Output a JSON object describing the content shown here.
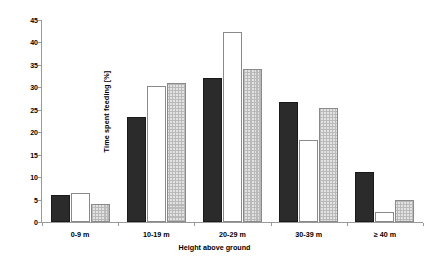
{
  "chart_data": {
    "type": "bar",
    "title": "",
    "xlabel": "Height above ground",
    "ylabel": "Time spent feeding [%]",
    "categories": [
      "0-9 m",
      "10-19 m",
      "20-29 m",
      "30-39 m",
      "≥ 40 m"
    ],
    "series": [
      {
        "name": "black",
        "fill": "black",
        "values": [
          6.0,
          23.5,
          32.1,
          26.8,
          11.2
        ]
      },
      {
        "name": "white",
        "fill": "white",
        "values": [
          6.4,
          30.2,
          42.4,
          18.3,
          2.3
        ]
      },
      {
        "name": "gray",
        "fill": "gray-stippled",
        "values": [
          4.1,
          31.0,
          34.1,
          25.5,
          5.0
        ]
      }
    ],
    "ylim": [
      0,
      45
    ],
    "yticks": [
      0,
      5,
      10,
      15,
      20,
      25,
      30,
      35,
      40,
      45
    ],
    "ytick_labels": [
      "0",
      "5",
      "10",
      "15",
      "20",
      "25",
      "30",
      "35",
      "40",
      "45"
    ],
    "grid": false,
    "legend": "none",
    "colors": {
      "black_bar": "#2b2b2b",
      "white_bar": "#ffffff",
      "gray_bar": "#e3e3e3",
      "axis": "#9a9a9a",
      "text": "#000000",
      "background": "#ffffff"
    }
  }
}
